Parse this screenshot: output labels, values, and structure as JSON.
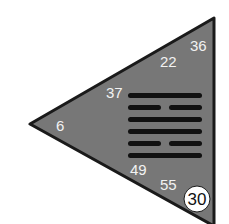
{
  "diagram": {
    "type": "i-ching-hexagram-triangle",
    "colors": {
      "triangle_fill": "#777777",
      "triangle_stroke": "#1a1a1a",
      "line_color": "#111111",
      "number_color": "#f2f2f2",
      "badge_fill": "#ffffff",
      "badge_text": "#111111"
    },
    "hexagram": {
      "number": "30",
      "lines_top_to_bottom": [
        "solid",
        "broken",
        "solid",
        "solid",
        "broken",
        "solid"
      ]
    },
    "labels": [
      {
        "text": "36",
        "x": 192,
        "y": 50
      },
      {
        "text": "22",
        "x": 160,
        "y": 67
      },
      {
        "text": "37",
        "x": 106,
        "y": 98
      },
      {
        "text": "6",
        "x": 56,
        "y": 131
      },
      {
        "text": "49",
        "x": 130,
        "y": 175
      },
      {
        "text": "55",
        "x": 160,
        "y": 190
      }
    ],
    "badge": {
      "text": "30",
      "cx": 197,
      "cy": 199,
      "r": 13
    }
  }
}
